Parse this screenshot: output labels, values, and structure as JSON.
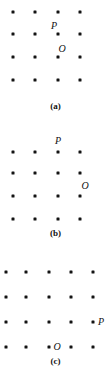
{
  "figure": {
    "title": "",
    "dot_color": "#131313",
    "background_color": "#ffffff",
    "panels": [
      {
        "id": "a",
        "caption": "(a)",
        "caption_y": 101,
        "grid": {
          "columns": 4,
          "rows": 4,
          "x": [
            13,
            35,
            58,
            80
          ],
          "y": [
            12,
            34,
            57,
            80
          ]
        },
        "labels": [
          {
            "text": "P",
            "x": 54,
            "y": 26
          },
          {
            "text": "O",
            "x": 62,
            "y": 49
          }
        ]
      },
      {
        "id": "b",
        "caption": "(b)",
        "caption_y": 98,
        "grid": {
          "columns": 4,
          "rows": 4,
          "x": [
            13,
            35,
            58,
            80
          ],
          "y": [
            22,
            43,
            66,
            89
          ]
        },
        "labels": [
          {
            "text": "P",
            "x": 58,
            "y": 11
          },
          {
            "text": "O",
            "x": 85,
            "y": 56
          }
        ]
      },
      {
        "id": "c",
        "caption": "(c)",
        "caption_y": 98,
        "grid": {
          "columns": 5,
          "rows": 4,
          "x": [
            6,
            26,
            49,
            71,
            93
          ],
          "y": [
            14,
            39,
            64,
            89
          ]
        },
        "labels": [
          {
            "text": "P",
            "x": 101,
            "y": 64
          },
          {
            "text": "O",
            "x": 57,
            "y": 89
          }
        ]
      }
    ]
  }
}
